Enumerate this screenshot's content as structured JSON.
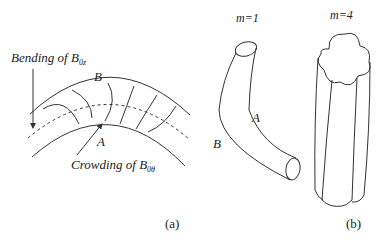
{
  "figure": {
    "panel_a": {
      "caption": "(a)",
      "label_top_prefix": "Bending of B",
      "label_top_sub": "0z",
      "label_bottom_prefix": "Crowding of B",
      "label_bottom_sub": "0θ",
      "point_b": "B",
      "point_a": "A"
    },
    "panel_b": {
      "caption": "(b)",
      "mode_1_label": "m=1",
      "mode_4_label": "m=4",
      "point_a": "A",
      "point_b": "B"
    },
    "colors": {
      "line": "#333333",
      "background": "#ffffff"
    }
  }
}
